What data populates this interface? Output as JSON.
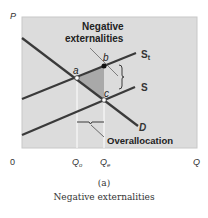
{
  "diagram": {
    "type": "supply-demand",
    "axes": {
      "y_label": "P",
      "x_label": "Q",
      "origin_label": "0",
      "x_ticks": [
        {
          "label": "Q",
          "subscript": "o"
        },
        {
          "label": "Q",
          "subscript": "e"
        }
      ]
    },
    "curves": [
      {
        "name": "D",
        "label": "D"
      },
      {
        "name": "S",
        "label": "S"
      },
      {
        "name": "St",
        "label": "S",
        "subscript": "t"
      }
    ],
    "points": [
      {
        "name": "a",
        "label": "a"
      },
      {
        "name": "b",
        "label": "b"
      },
      {
        "name": "c",
        "label": "c"
      }
    ],
    "annotations": {
      "externalities_line1": "Negative",
      "externalities_line2": "externalities",
      "overallocation": "Overallocation"
    },
    "colors": {
      "panel_bg": "#dcdcdc",
      "panel_border": "#c8c8c8",
      "curve": "#3a3a3a",
      "shaded_area": "#a9a9a9",
      "guide_lines": "#ffffff"
    }
  },
  "caption": {
    "panel": "(a)",
    "title": "Negative externalities"
  }
}
